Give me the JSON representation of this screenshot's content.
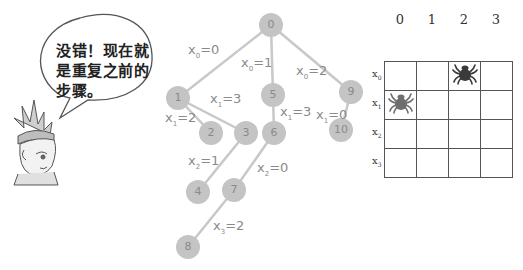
{
  "speech_bubble": {
    "lines": [
      "没错！现在就",
      "是重复之前的",
      "步骤。"
    ]
  },
  "tree": {
    "nodes": [
      {
        "id": "0",
        "x": 271,
        "y": 25
      },
      {
        "id": "1",
        "x": 178,
        "y": 98
      },
      {
        "id": "2",
        "x": 211,
        "y": 133
      },
      {
        "id": "3",
        "x": 246,
        "y": 133
      },
      {
        "id": "4",
        "x": 198,
        "y": 192
      },
      {
        "id": "5",
        "x": 273,
        "y": 95
      },
      {
        "id": "6",
        "x": 274,
        "y": 133
      },
      {
        "id": "7",
        "x": 234,
        "y": 190
      },
      {
        "id": "8",
        "x": 188,
        "y": 247
      },
      {
        "id": "9",
        "x": 351,
        "y": 92
      },
      {
        "id": "10",
        "x": 341,
        "y": 130
      }
    ],
    "edges": [
      {
        "from": "0",
        "to": "1",
        "var": "x",
        "sub": "0",
        "value": "=0",
        "lx": 188,
        "ly": 42
      },
      {
        "from": "0",
        "to": "5",
        "var": "x",
        "sub": "0",
        "value": "=1",
        "lx": 241,
        "ly": 55
      },
      {
        "from": "0",
        "to": "9",
        "var": "x",
        "sub": "0",
        "value": "=2",
        "lx": 296,
        "ly": 63
      },
      {
        "from": "1",
        "to": "2",
        "var": "x",
        "sub": "1",
        "value": "=2",
        "lx": 165,
        "ly": 110
      },
      {
        "from": "1",
        "to": "3",
        "var": "x",
        "sub": "1",
        "value": "=3",
        "lx": 210,
        "ly": 91
      },
      {
        "from": "3",
        "to": "4",
        "var": "x",
        "sub": "2",
        "value": "=1",
        "lx": 188,
        "ly": 153
      },
      {
        "from": "5",
        "to": "6",
        "var": "x",
        "sub": "1",
        "value": "=3",
        "lx": 280,
        "ly": 104
      },
      {
        "from": "6",
        "to": "7",
        "var": "x",
        "sub": "2",
        "value": "=0",
        "lx": 257,
        "ly": 160
      },
      {
        "from": "7",
        "to": "8",
        "var": "x",
        "sub": "3",
        "value": "=2",
        "lx": 213,
        "ly": 218
      },
      {
        "from": "9",
        "to": "10",
        "var": "x",
        "sub": "1",
        "value": "=0",
        "lx": 316,
        "ly": 107
      }
    ]
  },
  "board": {
    "col_labels": [
      "0",
      "1",
      "2",
      "3"
    ],
    "row_labels": [
      {
        "var": "x",
        "sub": "0"
      },
      {
        "var": "x",
        "sub": "1"
      },
      {
        "var": "x",
        "sub": "2"
      },
      {
        "var": "x",
        "sub": "3"
      }
    ],
    "queens": [
      {
        "row": 0,
        "col": 2,
        "color": "#3a3a3a",
        "icon": "spider-icon"
      },
      {
        "row": 1,
        "col": 0,
        "color": "#6e6e6e",
        "icon": "spider-icon"
      }
    ]
  }
}
